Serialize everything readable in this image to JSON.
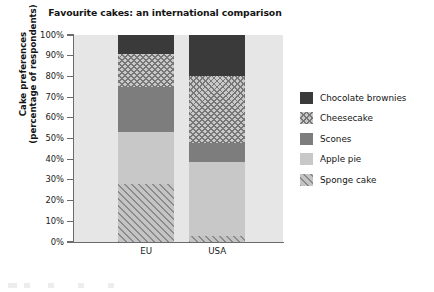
{
  "chart_data": {
    "type": "bar",
    "subtype": "stacked-bar-percentage",
    "title": "Favourite cakes: an international comparison",
    "xlabel": "Location",
    "ylabel_line1": "Cake preferences",
    "ylabel_line2": "(percentage of respondents)",
    "categories": [
      "EU",
      "USA"
    ],
    "ylim": [
      0,
      100
    ],
    "ytick_labels": [
      "100%",
      "90%",
      "80%",
      "70%",
      "60%",
      "50%",
      "40%",
      "30%",
      "20%",
      "10%",
      "0%"
    ],
    "ytick_values": [
      100,
      90,
      80,
      70,
      60,
      50,
      40,
      30,
      20,
      10,
      0
    ],
    "grid": false,
    "legend_position": "right",
    "series": [
      {
        "name": "Chocolate brownies",
        "values": [
          9,
          20
        ],
        "color": "#3a3a3a",
        "pattern": "solid"
      },
      {
        "name": "Cheesecake",
        "values": [
          16,
          32
        ],
        "color": "#c9c9c9",
        "pattern": "crosshatch"
      },
      {
        "name": "Scones",
        "values": [
          22,
          9.5
        ],
        "color": "#7d7d7d",
        "pattern": "solid"
      },
      {
        "name": "Apple pie",
        "values": [
          25,
          35.5
        ],
        "color": "#c8c8c8",
        "pattern": "solid"
      },
      {
        "name": "Sponge cake",
        "values": [
          28,
          3
        ],
        "color": "#c4c4c4",
        "pattern": "diagonal"
      }
    ],
    "stack_order_bottom_to_top": [
      "Sponge cake",
      "Apple pie",
      "Scones",
      "Cheesecake",
      "Chocolate brownies"
    ],
    "cumulative_tops": {
      "EU": {
        "Sponge cake": 28,
        "Apple pie": 53,
        "Scones": 75,
        "Cheesecake": 91,
        "Chocolate brownies": 100
      },
      "USA": {
        "Sponge cake": 3,
        "Apple pie": 38.5,
        "Scones": 48,
        "Cheesecake": 80,
        "Chocolate brownies": 100
      }
    }
  },
  "legend": {
    "items": [
      {
        "label": "Chocolate brownies",
        "swatch": "sw-brownies"
      },
      {
        "label": "Cheesecake",
        "swatch": "sw-cheesecake"
      },
      {
        "label": "Scones",
        "swatch": "sw-scones"
      },
      {
        "label": "Apple pie",
        "swatch": "sw-apple"
      },
      {
        "label": "Sponge cake",
        "swatch": "sw-sponge"
      }
    ]
  },
  "colors": {
    "plot_background": "#e6e6e6",
    "axis": "#6b6b6b",
    "text": "#141414"
  }
}
